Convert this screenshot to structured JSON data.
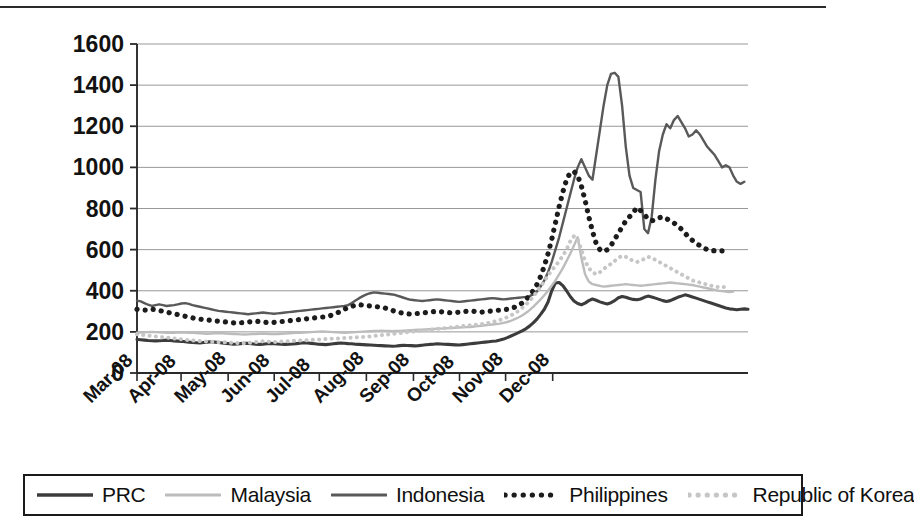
{
  "chart_data": {
    "type": "line",
    "title": "",
    "subtitle": "",
    "xlabel": "",
    "ylabel": "",
    "ylim": [
      0,
      1600
    ],
    "ytick_step": 200,
    "yticks": [
      "0",
      "200",
      "400",
      "600",
      "800",
      "1000",
      "1200",
      "1400",
      "1600"
    ],
    "grid": true,
    "legend_position": "bottom",
    "x_tick_labels": [
      "Mar-08",
      "Apr-08",
      "May-08",
      "Jun-08",
      "Jul-08",
      "Aug-08",
      "Sep-08",
      "Oct-08",
      "Nov-08",
      "Dec-08"
    ],
    "x_domain": [
      0,
      61
    ],
    "x_tick_positions": [
      0,
      4.4,
      9.1,
      13.7,
      18.2,
      22.9,
      27.6,
      32.2,
      36.8,
      41.5
    ],
    "series": [
      {
        "name": "PRC",
        "color": "#3c3c3c",
        "style": "solid",
        "width": 3.1,
        "values": [
          163,
          162,
          160,
          158,
          157,
          156,
          157,
          158,
          160,
          158,
          156,
          155,
          154,
          152,
          150,
          148,
          147,
          146,
          148,
          150,
          152,
          150,
          148,
          146,
          144,
          142,
          140,
          141,
          143,
          145,
          144,
          142,
          140,
          139,
          140,
          142,
          144,
          143,
          141,
          140,
          139,
          140,
          141,
          143,
          145,
          147,
          146,
          144,
          142,
          140,
          139,
          138,
          140,
          142,
          144,
          146,
          145,
          143,
          142,
          140,
          139,
          138,
          137,
          136,
          135,
          134,
          133,
          132,
          131,
          130,
          131,
          133,
          135,
          134,
          133,
          132,
          133,
          135,
          137,
          139,
          140,
          142,
          141,
          140,
          139,
          138,
          137,
          136,
          138,
          140,
          142,
          144,
          146,
          148,
          150,
          152,
          154,
          156,
          160,
          165,
          172,
          180,
          188,
          196,
          205,
          215,
          228,
          244,
          262,
          285,
          310,
          345,
          400,
          438,
          440,
          425,
          400,
          372,
          350,
          338,
          332,
          340,
          352,
          360,
          354,
          346,
          340,
          336,
          342,
          352,
          366,
          372,
          368,
          362,
          358,
          356,
          360,
          368,
          374,
          370,
          364,
          358,
          352,
          348,
          352,
          360,
          368,
          374,
          380,
          376,
          370,
          364,
          358,
          352,
          346,
          340,
          334,
          328,
          322,
          316,
          312,
          310,
          308,
          310,
          312,
          310
        ]
      },
      {
        "name": "Malaysia",
        "color": "#bcbcbc",
        "style": "solid",
        "width": 2.4,
        "values": [
          196,
          197,
          198,
          199,
          200,
          199,
          198,
          197,
          196,
          195,
          196,
          197,
          198,
          197,
          196,
          195,
          194,
          193,
          192,
          191,
          192,
          193,
          194,
          193,
          192,
          191,
          190,
          189,
          188,
          187,
          188,
          189,
          190,
          191,
          192,
          191,
          190,
          189,
          190,
          191,
          192,
          193,
          194,
          195,
          196,
          197,
          198,
          199,
          200,
          201,
          202,
          201,
          200,
          199,
          198,
          197,
          196,
          197,
          198,
          199,
          200,
          201,
          202,
          203,
          204,
          205,
          206,
          205,
          204,
          203,
          204,
          205,
          206,
          207,
          208,
          209,
          210,
          211,
          212,
          213,
          214,
          215,
          216,
          217,
          218,
          219,
          220,
          221,
          222,
          223,
          224,
          226,
          228,
          230,
          232,
          234,
          236,
          238,
          240,
          244,
          248,
          254,
          262,
          270,
          280,
          292,
          306,
          322,
          340,
          358,
          378,
          400,
          425,
          450,
          480,
          510,
          545,
          580,
          620,
          660,
          560,
          480,
          445,
          432,
          428,
          424,
          420,
          422,
          424,
          426,
          428,
          430,
          432,
          430,
          428,
          426,
          424,
          426,
          428,
          430,
          432,
          434,
          436,
          438,
          440,
          438,
          436,
          434,
          432,
          430,
          428,
          424,
          420,
          416,
          412,
          408,
          404,
          400,
          398,
          396,
          394,
          396
        ]
      },
      {
        "name": "Indonesia",
        "color": "#595959",
        "style": "solid",
        "width": 2.4,
        "values": [
          352,
          348,
          340,
          332,
          326,
          330,
          334,
          330,
          326,
          328,
          330,
          334,
          338,
          340,
          336,
          330,
          326,
          322,
          318,
          314,
          310,
          306,
          302,
          300,
          298,
          296,
          294,
          292,
          290,
          288,
          286,
          288,
          290,
          292,
          294,
          292,
          290,
          288,
          290,
          292,
          294,
          296,
          298,
          300,
          302,
          304,
          306,
          308,
          310,
          312,
          314,
          316,
          318,
          320,
          322,
          324,
          326,
          330,
          340,
          352,
          364,
          374,
          382,
          388,
          392,
          390,
          388,
          386,
          384,
          382,
          378,
          372,
          366,
          360,
          356,
          354,
          352,
          350,
          352,
          354,
          356,
          358,
          356,
          354,
          352,
          350,
          348,
          346,
          348,
          350,
          352,
          354,
          356,
          358,
          360,
          362,
          364,
          362,
          360,
          358,
          360,
          362,
          364,
          366,
          368,
          370,
          374,
          382,
          396,
          420,
          450,
          490,
          540,
          600,
          660,
          730,
          800,
          870,
          940,
          1000,
          1040,
          1000,
          960,
          940,
          1060,
          1180,
          1300,
          1400,
          1455,
          1460,
          1440,
          1300,
          1100,
          960,
          900,
          890,
          880,
          700,
          680,
          760,
          940,
          1080,
          1160,
          1210,
          1190,
          1230,
          1250,
          1220,
          1190,
          1150,
          1160,
          1180,
          1160,
          1130,
          1100,
          1080,
          1060,
          1030,
          1000,
          1010,
          1000,
          960,
          930,
          920,
          930
        ]
      },
      {
        "name": "Philippines",
        "color": "#1c1c1c",
        "style": "dotted",
        "width": 5.2,
        "values": [
          310,
          308,
          306,
          305,
          310,
          308,
          304,
          300,
          296,
          292,
          288,
          284,
          280,
          276,
          272,
          268,
          264,
          262,
          260,
          258,
          256,
          254,
          252,
          250,
          248,
          246,
          244,
          242,
          244,
          246,
          248,
          250,
          252,
          250,
          248,
          246,
          244,
          246,
          248,
          250,
          252,
          254,
          256,
          258,
          260,
          262,
          264,
          266,
          268,
          270,
          272,
          274,
          278,
          284,
          292,
          300,
          310,
          318,
          324,
          330,
          332,
          330,
          328,
          326,
          324,
          322,
          320,
          316,
          310,
          304,
          298,
          294,
          290,
          288,
          286,
          288,
          290,
          292,
          294,
          296,
          298,
          300,
          298,
          296,
          294,
          292,
          294,
          296,
          298,
          300,
          302,
          300,
          298,
          296,
          298,
          300,
          302,
          304,
          306,
          308,
          310,
          314,
          320,
          328,
          340,
          356,
          376,
          400,
          430,
          470,
          520,
          580,
          650,
          730,
          810,
          880,
          940,
          975,
          980,
          960,
          910,
          840,
          760,
          690,
          630,
          600,
          590,
          600,
          620,
          650,
          680,
          710,
          740,
          760,
          780,
          805,
          790,
          770,
          750,
          740,
          745,
          755,
          760,
          750,
          740,
          730,
          715,
          700,
          680,
          660,
          645,
          630,
          620,
          610,
          600,
          595,
          595,
          596,
          594,
          595
        ]
      },
      {
        "name": "Republic of Korea",
        "color": "#c6c6c6",
        "style": "dotted",
        "width": 4.0,
        "values": [
          188,
          186,
          184,
          182,
          180,
          178,
          176,
          174,
          172,
          170,
          168,
          166,
          164,
          162,
          160,
          158,
          156,
          155,
          154,
          153,
          152,
          151,
          150,
          150,
          149,
          148,
          147,
          146,
          145,
          144,
          146,
          148,
          150,
          152,
          154,
          153,
          152,
          151,
          152,
          153,
          154,
          155,
          156,
          157,
          158,
          159,
          160,
          161,
          162,
          163,
          164,
          165,
          166,
          167,
          168,
          169,
          170,
          171,
          172,
          173,
          174,
          175,
          176,
          178,
          180,
          182,
          184,
          186,
          188,
          190,
          192,
          194,
          196,
          198,
          200,
          202,
          204,
          206,
          208,
          210,
          212,
          214,
          216,
          218,
          220,
          222,
          224,
          226,
          228,
          230,
          232,
          234,
          236,
          238,
          240,
          244,
          248,
          252,
          258,
          264,
          272,
          280,
          290,
          302,
          316,
          332,
          350,
          372,
          396,
          420,
          446,
          474,
          500,
          520,
          545,
          570,
          600,
          640,
          665,
          650,
          600,
          545,
          510,
          490,
          480,
          490,
          505,
          520,
          530,
          545,
          560,
          570,
          565,
          555,
          545,
          540,
          545,
          555,
          565,
          560,
          550,
          540,
          530,
          520,
          510,
          500,
          490,
          480,
          470,
          460,
          450,
          445,
          440,
          435,
          430,
          425,
          420,
          418,
          416,
          420
        ]
      }
    ]
  },
  "legend": {
    "items": [
      {
        "label": "PRC",
        "swatch": "solid-thick-dark"
      },
      {
        "label": "Malaysia",
        "swatch": "solid-light"
      },
      {
        "label": "Indonesia",
        "swatch": "solid-medium"
      },
      {
        "label": "Philippines",
        "swatch": "dotted-dark"
      },
      {
        "label": "Republic of Korea",
        "swatch": "dotted-light"
      }
    ]
  },
  "axes": {
    "y_axis_color": "#2a2a2a",
    "grid_color": "#8c8c8c",
    "tick_label_color": "#121212"
  }
}
